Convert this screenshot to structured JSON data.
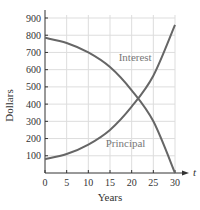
{
  "chart_data": {
    "type": "line",
    "title": "",
    "xlabel": "Years",
    "ylabel": "Dollars",
    "axis_arrow_label": "t",
    "xlim": [
      0,
      30
    ],
    "ylim": [
      0,
      900
    ],
    "x_ticks": [
      0,
      5,
      10,
      15,
      20,
      25,
      30
    ],
    "y_ticks": [
      100,
      200,
      300,
      400,
      500,
      600,
      700,
      800,
      900
    ],
    "grid": true,
    "x": [
      0,
      5,
      10,
      15,
      20,
      25,
      30
    ],
    "series": [
      {
        "name": "Interest",
        "values": [
          785,
          755,
          700,
          615,
          480,
          300,
          0
        ]
      },
      {
        "name": "Principal",
        "values": [
          80,
          110,
          165,
          250,
          385,
          565,
          860
        ]
      }
    ],
    "annotations": [
      {
        "text": "Interest",
        "x": 17,
        "y": 650
      },
      {
        "text": "Principal",
        "x": 14,
        "y": 150
      }
    ],
    "colors": {
      "curve": "#666666",
      "grid": "#dddddd",
      "axis": "#333333",
      "label": "#777777"
    }
  }
}
